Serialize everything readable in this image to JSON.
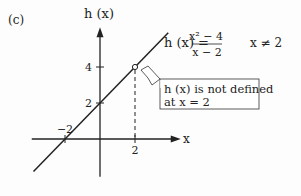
{
  "panel_label": "(c)",
  "chart_data": {
    "type": "line",
    "title": "",
    "xlabel": "x",
    "ylabel": "h (x)",
    "function_label": "h (x) =",
    "numerator": "x² − 4",
    "denominator": "x − 2",
    "condition": "x ≠ 2",
    "x_ticks": [
      {
        "value": -2,
        "label": "−2"
      },
      {
        "value": 2,
        "label": "2"
      }
    ],
    "y_ticks": [
      {
        "value": 2,
        "label": "2"
      },
      {
        "value": 4,
        "label": "4"
      }
    ],
    "xlim": [
      -3.9,
      4.5
    ],
    "ylim": [
      -2.1,
      6.1
    ],
    "series": [
      {
        "name": "h(x) = x + 2",
        "x": [
          -3.8,
          3.9
        ],
        "y": [
          -1.8,
          5.9
        ]
      }
    ],
    "hole": {
      "x": 2,
      "y": 4
    },
    "annotation_lines": [
      "h (x) is not defined",
      "at x = 2"
    ],
    "grid": false
  }
}
